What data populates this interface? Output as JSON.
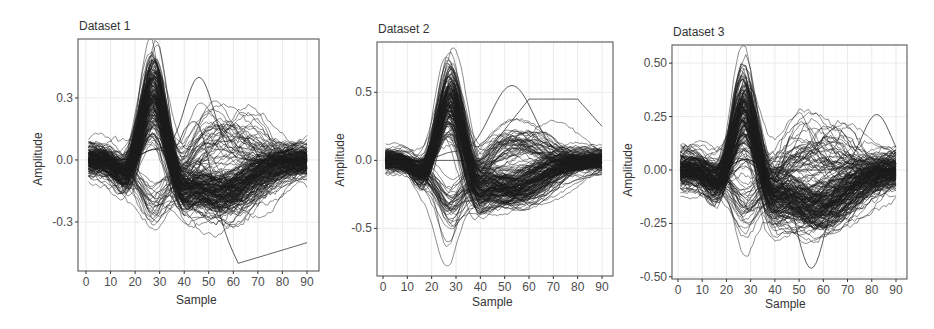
{
  "chart_data": [
    {
      "type": "line",
      "title": "Dataset 1",
      "xlabel": "Sample",
      "ylabel": "Amplitude",
      "x_ticks": [
        0,
        10,
        20,
        30,
        40,
        50,
        60,
        70,
        80,
        90
      ],
      "y_ticks": [
        0.3,
        0.0,
        -0.3
      ],
      "y_tick_labels": [
        "0.3",
        "0.0",
        "-0.3"
      ],
      "xlim": [
        -1,
        92
      ],
      "ylim": [
        -0.537,
        0.585
      ],
      "grid": true,
      "legend": "none",
      "n_series_approx": 200,
      "description": "Overlaid waveforms: dense positive peak near sample 28 (up to ~0.55), subset of inverted troughs near sample 28 (~ -0.3), broad negative trough around samples 50-60 (~ -0.15 to -0.35), outliers peaking ~0.4 at sample 46 and dropping to ~ -0.5 at sample 60",
      "x": [
        0,
        10,
        20,
        28,
        35,
        40,
        50,
        60,
        70,
        80,
        90
      ],
      "series": [
        {
          "name": "typical",
          "values": [
            0.0,
            -0.02,
            0.1,
            0.3,
            0.15,
            -0.05,
            -0.15,
            -0.12,
            -0.07,
            -0.04,
            -0.03
          ]
        },
        {
          "name": "max_envelope",
          "values": [
            0.18,
            0.15,
            0.3,
            0.55,
            0.3,
            0.1,
            0.4,
            0.2,
            0.28,
            0.27,
            0.18
          ]
        },
        {
          "name": "min_envelope",
          "values": [
            -0.12,
            -0.18,
            -0.22,
            -0.32,
            -0.2,
            -0.2,
            -0.38,
            -0.5,
            -0.48,
            -0.45,
            -0.42
          ]
        }
      ]
    },
    {
      "type": "line",
      "title": "Dataset 2",
      "xlabel": "Sample",
      "ylabel": "Amplitude",
      "x_ticks": [
        0,
        10,
        20,
        30,
        40,
        50,
        60,
        70,
        80,
        90
      ],
      "y_ticks": [
        0.5,
        0.0,
        -0.5
      ],
      "y_tick_labels": [
        "0.5",
        "0.0",
        "-0.5"
      ],
      "xlim": [
        -2,
        94
      ],
      "ylim": [
        -0.85,
        0.87
      ],
      "grid": true,
      "legend": "none",
      "n_series_approx": 200,
      "description": "Overlaid waveforms: dense positive peak near sample 28 (up to ~0.8), inverted troughs near sample 27 (down to ~ -0.78), broad trough around sample 50-55 (~ -0.55), outliers peaking ~0.55 at sample 53 and ~0.5 at sample 75",
      "x": [
        0,
        10,
        20,
        28,
        35,
        40,
        50,
        60,
        70,
        80,
        90
      ],
      "series": [
        {
          "name": "typical",
          "values": [
            0.0,
            -0.03,
            0.12,
            0.4,
            0.2,
            -0.05,
            -0.2,
            -0.12,
            -0.07,
            -0.04,
            -0.03
          ]
        },
        {
          "name": "max_envelope",
          "values": [
            0.12,
            0.15,
            0.3,
            0.8,
            0.4,
            0.1,
            0.55,
            0.45,
            0.48,
            0.45,
            0.25
          ]
        },
        {
          "name": "min_envelope",
          "values": [
            -0.12,
            -0.25,
            -0.3,
            -0.78,
            -0.4,
            -0.1,
            -0.55,
            -0.4,
            -0.2,
            -0.15,
            -0.12
          ]
        }
      ]
    },
    {
      "type": "line",
      "title": "Dataset 3",
      "xlabel": "Sample",
      "ylabel": "Amplitude",
      "x_ticks": [
        0,
        10,
        20,
        30,
        40,
        50,
        60,
        70,
        80,
        90
      ],
      "y_ticks": [
        0.5,
        0.25,
        0.0,
        -0.25,
        -0.5
      ],
      "y_tick_labels": [
        "0.50",
        "0.25",
        "0.00",
        "-0.25",
        "-0.50"
      ],
      "xlim": [
        -2,
        93
      ],
      "ylim": [
        -0.51,
        0.585
      ],
      "grid": true,
      "legend": "none",
      "n_series_approx": 200,
      "description": "Overlaid waveforms: dense positive peak near sample 28 (up to ~0.53), inverted troughs near sample 27 (down to ~ -0.47), broad trough around samples 50-60 (~ -0.2 to -0.35), outlier trough ~ -0.46 at sample 55, outliers up to ~0.26 at sample 82",
      "x": [
        0,
        10,
        20,
        28,
        35,
        40,
        50,
        60,
        70,
        80,
        90
      ],
      "series": [
        {
          "name": "typical",
          "values": [
            0.0,
            -0.02,
            0.1,
            0.25,
            0.15,
            0.0,
            -0.15,
            -0.15,
            -0.1,
            -0.06,
            -0.04
          ]
        },
        {
          "name": "max_envelope",
          "values": [
            0.13,
            0.15,
            0.2,
            0.53,
            0.3,
            0.1,
            0.22,
            0.2,
            0.15,
            0.26,
            0.18
          ]
        },
        {
          "name": "min_envelope",
          "values": [
            -0.1,
            -0.2,
            -0.15,
            -0.47,
            -0.3,
            -0.15,
            -0.35,
            -0.46,
            -0.3,
            -0.2,
            -0.17
          ]
        }
      ]
    }
  ],
  "panels": [
    {
      "title": "Dataset 1",
      "xlabel": "Sample",
      "ylabel": "Amplitude"
    },
    {
      "title": "Dataset 2",
      "xlabel": "Sample",
      "ylabel": "Amplitude"
    },
    {
      "title": "Dataset 3",
      "xlabel": "Sample",
      "ylabel": "Amplitude"
    }
  ],
  "colors": {
    "line": "#1a1a1a",
    "frame": "#666666",
    "grid": "#ebebeb",
    "tick_text": "#4d4d4d",
    "background": "#ffffff"
  }
}
